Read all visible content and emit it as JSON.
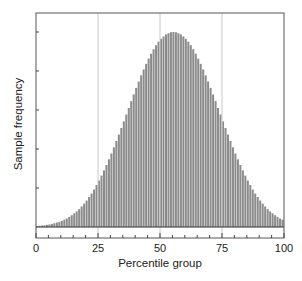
{
  "chart_data": {
    "type": "bar",
    "title": "",
    "xlabel": "Percentile group",
    "ylabel": "Sample frequency",
    "xlim": [
      0,
      100
    ],
    "ylim": [
      0,
      1.0
    ],
    "x_ticks": [
      0,
      25,
      50,
      75,
      100
    ],
    "x_tick_labels": [
      "0",
      "25",
      "50",
      "75",
      "100"
    ],
    "x_minor_tick_step": 5,
    "y_ticks_relative": [
      0.2,
      0.4,
      0.6,
      0.8,
      1.0
    ],
    "y_tick_labels": [],
    "grid": {
      "vertical_at": [
        25,
        50,
        75
      ],
      "horizontal": false
    },
    "legend": null,
    "bar_color": "#8c8c8c",
    "center": 50,
    "sd_in_groups": 15,
    "categories": [
      1,
      2,
      3,
      4,
      5,
      6,
      7,
      8,
      9,
      10,
      11,
      12,
      13,
      14,
      15,
      16,
      17,
      18,
      19,
      20,
      21,
      22,
      23,
      24,
      25,
      26,
      27,
      28,
      29,
      30,
      31,
      32,
      33,
      34,
      35,
      36,
      37,
      38,
      39,
      40,
      41,
      42,
      43,
      44,
      45,
      46,
      47,
      48,
      49,
      50,
      51,
      52,
      53,
      54,
      55,
      56,
      57,
      58,
      59,
      60,
      61,
      62,
      63,
      64,
      65,
      66,
      67,
      68,
      69,
      70,
      71,
      72,
      73,
      74,
      75,
      76,
      77,
      78,
      79,
      80,
      81,
      82,
      83,
      84,
      85,
      86,
      87,
      88,
      89,
      90,
      91,
      92,
      93,
      94,
      95,
      96,
      97,
      98,
      99,
      100
    ],
    "values": [
      0.004,
      0.005,
      0.006,
      0.007,
      0.009,
      0.011,
      0.013,
      0.016,
      0.019,
      0.022,
      0.026,
      0.031,
      0.036,
      0.043,
      0.05,
      0.058,
      0.066,
      0.076,
      0.087,
      0.099,
      0.112,
      0.127,
      0.142,
      0.159,
      0.178,
      0.197,
      0.218,
      0.24,
      0.263,
      0.287,
      0.312,
      0.338,
      0.365,
      0.392,
      0.42,
      0.448,
      0.477,
      0.505,
      0.534,
      0.562,
      0.59,
      0.617,
      0.643,
      0.668,
      0.692,
      0.714,
      0.735,
      0.754,
      0.771,
      0.786,
      0.798,
      0.808,
      0.817,
      0.822,
      0.826,
      0.827,
      0.826,
      0.822,
      0.817,
      0.808,
      0.798,
      0.786,
      0.771,
      0.754,
      0.735,
      0.714,
      0.692,
      0.668,
      0.643,
      0.617,
      0.59,
      0.562,
      0.534,
      0.505,
      0.477,
      0.448,
      0.42,
      0.392,
      0.365,
      0.338,
      0.312,
      0.287,
      0.263,
      0.24,
      0.218,
      0.197,
      0.178,
      0.159,
      0.142,
      0.127,
      0.112,
      0.099,
      0.087,
      0.076,
      0.066,
      0.058,
      0.05,
      0.043,
      0.036,
      0.031
    ]
  },
  "labels": {
    "xlabel": "Percentile group",
    "ylabel": "Sample frequency",
    "x_tick_0": "0",
    "x_tick_25": "25",
    "x_tick_50": "50",
    "x_tick_75": "75",
    "x_tick_100": "100"
  }
}
